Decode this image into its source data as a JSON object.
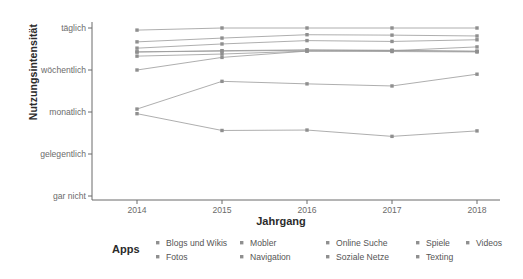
{
  "chart_data": {
    "type": "line",
    "title": "",
    "xlabel": "Jahrgang",
    "ylabel": "Nutzungsintensität",
    "legend_title": "Apps",
    "legend_position": "bottom",
    "grid": false,
    "x": [
      2014,
      2015,
      2016,
      2017,
      2018
    ],
    "categories": [
      "2014",
      "2015",
      "2016",
      "2017",
      "2018"
    ],
    "y_categories": [
      "gar nicht",
      "gelegentlich",
      "monatlich",
      "wöchentlich",
      "täglich"
    ],
    "ylim": [
      "gar nicht",
      "täglich"
    ],
    "y_scale_note": "ordinal 1=gar nicht, 2=gelegentlich, 3=monatlich, 4=wöchentlich, 5=täglich",
    "series": [
      {
        "name": "Blogs und Wikis",
        "color": "#999999",
        "values": [
          2.96,
          2.56,
          2.57,
          2.42,
          2.55
        ],
        "values_label": [
          "gelegentlich+",
          "gelegentlich",
          "gelegentlich",
          "gelegentlich-",
          "gelegentlich"
        ]
      },
      {
        "name": "Fotos",
        "color": "#999999",
        "values": [
          4.67,
          4.76,
          4.84,
          4.83,
          4.81
        ],
        "values_label": [
          "täglich-",
          "täglich-",
          "täglich",
          "täglich",
          "täglich"
        ]
      },
      {
        "name": "Mobler",
        "color": "#999999",
        "values": [
          4.43,
          4.45,
          4.47,
          4.46,
          4.45
        ],
        "values_label": [
          "wöchentlich+",
          "wöchentlich+",
          "wöchentlich+",
          "wöchentlich+",
          "wöchentlich+"
        ]
      },
      {
        "name": "Navigation",
        "color": "#999999",
        "values": [
          4.33,
          4.38,
          4.45,
          4.44,
          4.43
        ],
        "values_label": [
          "wöchentlich+",
          "wöchentlich+",
          "wöchentlich+",
          "wöchentlich+",
          "wöchentlich+"
        ]
      },
      {
        "name": "Online Suche",
        "color": "#999999",
        "values": [
          4.95,
          5.0,
          5.0,
          5.0,
          5.0
        ],
        "values_label": [
          "täglich",
          "täglich",
          "täglich",
          "täglich",
          "täglich"
        ]
      },
      {
        "name": "Soziale Netze",
        "color": "#999999",
        "values": [
          4.52,
          4.62,
          4.7,
          4.68,
          4.72
        ],
        "values_label": [
          "täglich-",
          "täglich-",
          "täglich-",
          "täglich-",
          "täglich-"
        ]
      },
      {
        "name": "Spiele",
        "color": "#999999",
        "values": [
          3.07,
          3.73,
          3.67,
          3.62,
          3.9
        ],
        "values_label": [
          "monatlich",
          "monatlich+",
          "monatlich+",
          "monatlich+",
          "wöchentlich-"
        ]
      },
      {
        "name": "Texting",
        "color": "#999999",
        "values": [
          4.43,
          4.46,
          4.48,
          4.47,
          4.44
        ],
        "values_label": [
          "wöchentlich+",
          "wöchentlich+",
          "wöchentlich+",
          "wöchentlich+",
          "wöchentlich+"
        ]
      },
      {
        "name": "Videos",
        "color": "#999999",
        "values": [
          4.0,
          4.3,
          4.45,
          4.46,
          4.55
        ],
        "values_label": [
          "wöchentlich",
          "wöchentlich+",
          "wöchentlich+",
          "wöchentlich+",
          "wöchentlich+"
        ]
      }
    ]
  },
  "axes": {
    "y_title": "Nutzungsintensität",
    "x_title": "Jahrgang",
    "y_ticks": [
      "täglich",
      "wöchentlich",
      "monatlich",
      "gelegentlich",
      "gar nicht"
    ],
    "x_ticks": [
      "2014",
      "2015",
      "2016",
      "2017",
      "2018"
    ]
  },
  "legend": {
    "title": "Apps",
    "items": [
      {
        "label": "Blogs und Wikis",
        "key": "point-marker-icon"
      },
      {
        "label": "Fotos",
        "key": "point-marker-icon"
      },
      {
        "label": "Mobler",
        "key": "point-marker-icon"
      },
      {
        "label": "Navigation",
        "key": "point-marker-icon"
      },
      {
        "label": "Online Suche",
        "key": "point-marker-icon"
      },
      {
        "label": "Soziale Netze",
        "key": "point-marker-icon"
      },
      {
        "label": "Spiele",
        "key": "point-marker-icon"
      },
      {
        "label": "Texting",
        "key": "point-marker-icon"
      },
      {
        "label": "Videos",
        "key": "point-marker-icon"
      }
    ]
  },
  "style": {
    "line_color": "#a0a0a0",
    "axis_color": "#6b6b6b",
    "text_color": "#4d4d4d",
    "background": "#ffffff"
  }
}
